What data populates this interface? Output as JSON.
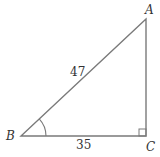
{
  "diagram": {
    "type": "right-triangle",
    "vertices": {
      "A": {
        "label": "A"
      },
      "B": {
        "label": "B"
      },
      "C": {
        "label": "C"
      }
    },
    "sides": {
      "hypotenuse_AB": "47",
      "base_BC": "35"
    },
    "marks": {
      "right_angle_at": "C",
      "angle_arc_at": "B"
    },
    "colors": {
      "line": "#7a7a7a",
      "text": "#333333"
    }
  }
}
